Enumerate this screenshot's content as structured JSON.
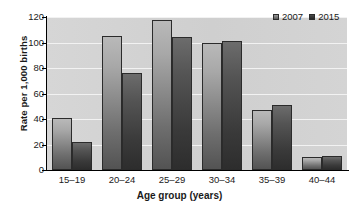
{
  "chart_data": {
    "type": "bar",
    "title": "",
    "subtitle": "",
    "xlabel": "Age group (years)",
    "ylabel": "Rate per 1,000 births",
    "categories": [
      "15–19",
      "20–24",
      "25–29",
      "30–34",
      "35–39",
      "40–44"
    ],
    "series": [
      {
        "name": "2007",
        "values": [
          41,
          105,
          118,
          100,
          47,
          10
        ],
        "color": "#8c8c8c"
      },
      {
        "name": "2015",
        "values": [
          22,
          76,
          104,
          101,
          51,
          11
        ],
        "color": "#3a3a3a"
      }
    ],
    "ylim": [
      0,
      120
    ],
    "ytick_labels": [
      "0",
      "20",
      "40",
      "60",
      "80",
      "100",
      "120"
    ],
    "ytick_values": [
      0,
      20,
      40,
      60,
      80,
      100,
      120
    ],
    "grid": true,
    "grid_axis": "y",
    "legend_position": "top-right",
    "plot_background": "#d2d2d2",
    "gridline_color": "#f2f2f2",
    "axis_color": "#000000"
  },
  "legend": {
    "entries": [
      {
        "label": "2007",
        "swatch": "series-2007-swatch"
      },
      {
        "label": "2015",
        "swatch": "series-2015-swatch"
      }
    ]
  },
  "axes": {
    "x_title": "Age group (years)",
    "y_title": "Rate per 1,000 births"
  }
}
